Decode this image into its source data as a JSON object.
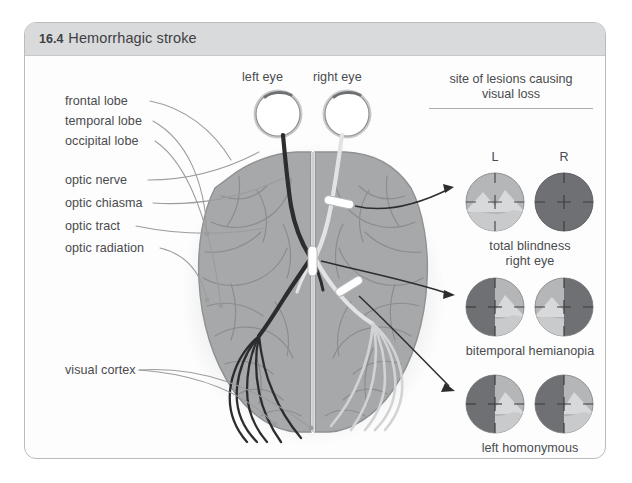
{
  "figure": {
    "number": "16.4",
    "title": "Hemorrhagic stroke"
  },
  "eyes": {
    "left_label": "left eye",
    "right_label": "right eye"
  },
  "anatomy_labels": [
    {
      "id": "frontal-lobe",
      "text": "frontal lobe"
    },
    {
      "id": "temporal-lobe",
      "text": "temporal lobe"
    },
    {
      "id": "occipital-lobe",
      "text": "occipital lobe"
    },
    {
      "id": "optic-nerve",
      "text": "optic nerve"
    },
    {
      "id": "optic-chiasma",
      "text": "optic chiasma"
    },
    {
      "id": "optic-tract",
      "text": "optic tract"
    },
    {
      "id": "optic-radiation",
      "text": "optic radiation"
    },
    {
      "id": "visual-cortex",
      "text": "visual cortex"
    }
  ],
  "lesion_panel": {
    "title_line1": "site of lesions causing",
    "title_line2": "visual loss",
    "column_left": "L",
    "column_right": "R",
    "rows": [
      {
        "id": "total-blindness-right-eye",
        "caption_line1": "total blindness",
        "caption_line2": "right eye",
        "left_field": "full",
        "right_field": "blind"
      },
      {
        "id": "bitemporal-hemianopia",
        "caption_line1": "bitemporal hemianopia",
        "caption_line2": "",
        "left_field": "temporal-left-lost",
        "right_field": "temporal-right-lost"
      },
      {
        "id": "left-homonymous-hemianopia",
        "caption_line1": "left homonymous",
        "caption_line2": "hemianopia",
        "left_field": "left-half-lost",
        "right_field": "left-half-lost"
      }
    ]
  },
  "colors": {
    "frame_border": "#b9bbbd",
    "header_bg": "#d9dadb",
    "text": "#4a4b4e",
    "brain_fill": "#a6a8aa",
    "brain_outline": "#8e9092",
    "sulci": "#8a8c8e",
    "tract_dark": "#2c2d2f",
    "tract_light": "#e2e3e4",
    "lesion_marker": "#ffffff",
    "field_seeing": "#b4b6b8",
    "field_lost": "#6e7073",
    "leader_line": "#9a9c9e",
    "arrow": "#2c2d2f"
  }
}
